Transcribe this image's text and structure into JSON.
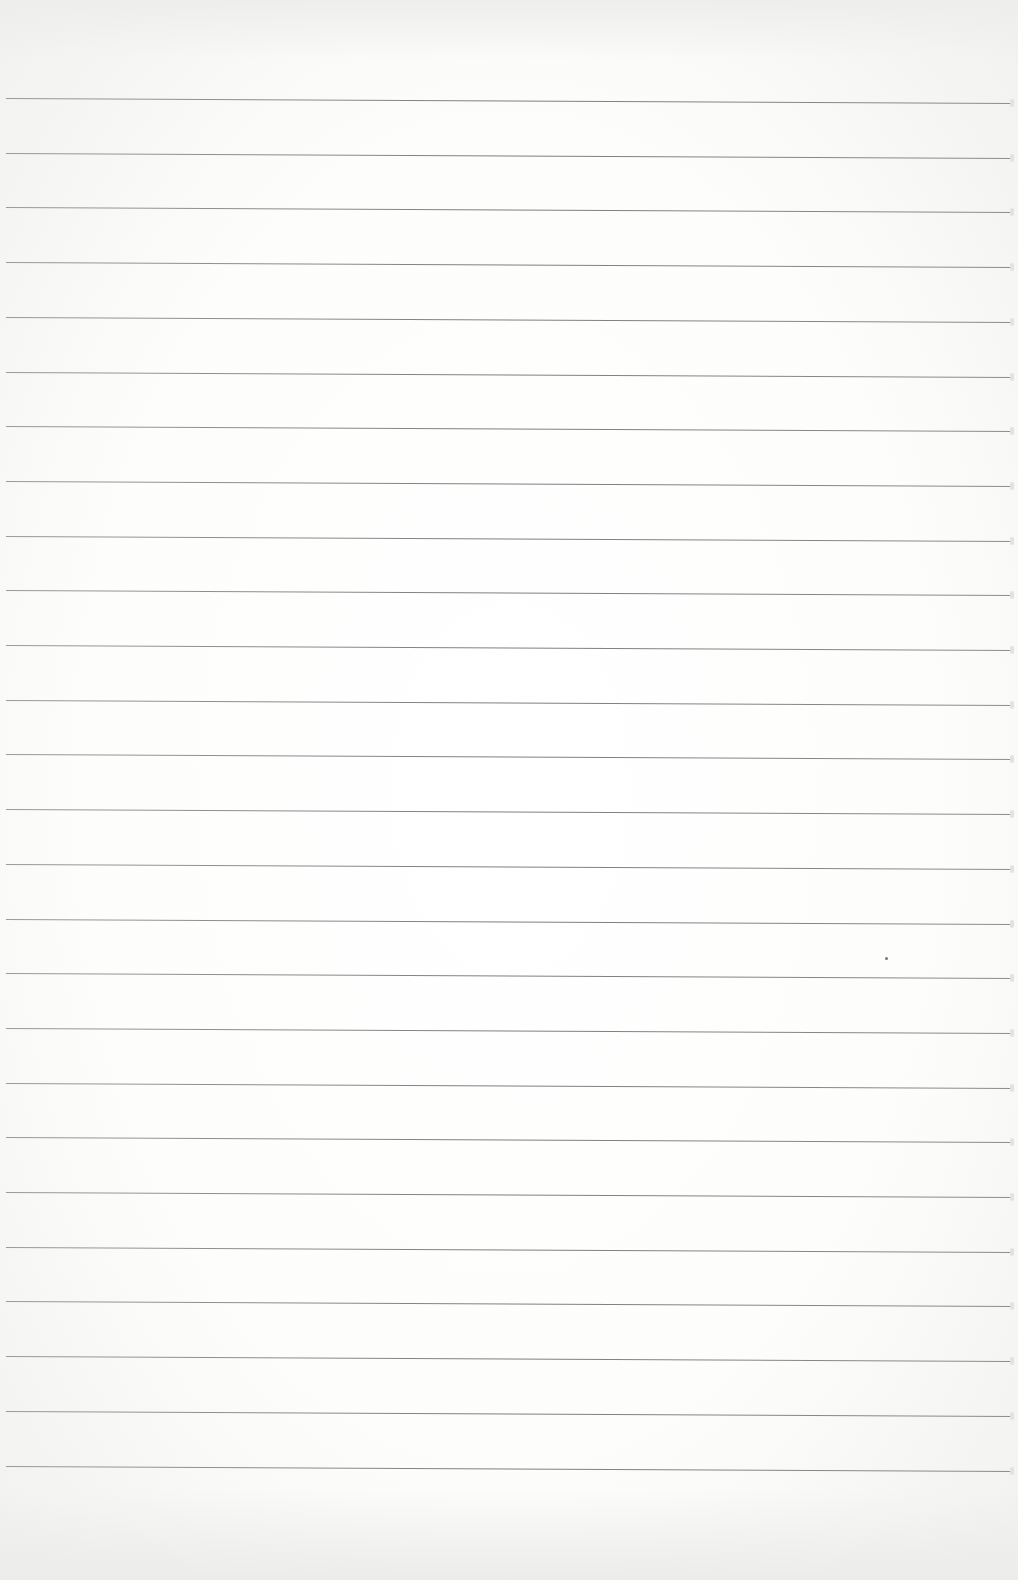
{
  "page": {
    "type": "blank ruled notebook page",
    "text": ""
  },
  "rules": {
    "count": 26,
    "first_y": 98,
    "spacing": 54.7,
    "color": "#8a8a8a"
  },
  "colors": {
    "paper": "#fdfdfc",
    "line": "#8a8a8a"
  }
}
